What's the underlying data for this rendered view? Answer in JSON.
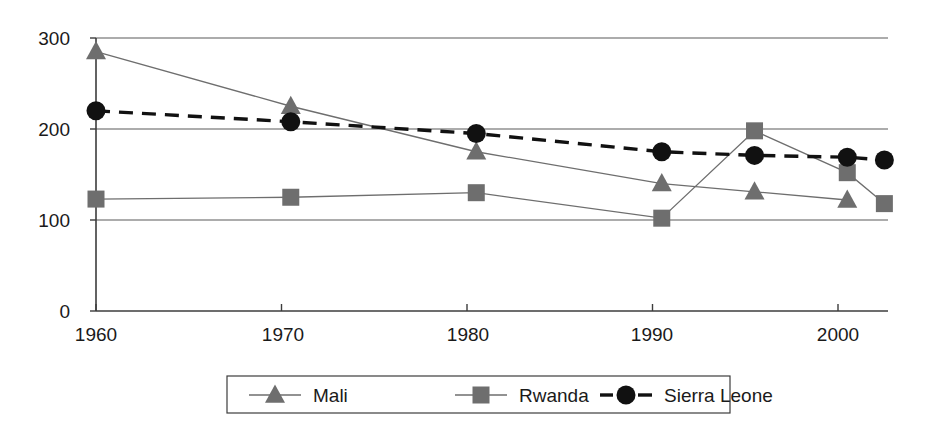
{
  "chart_data": {
    "type": "line",
    "title": "",
    "subtitle": "",
    "xlabel": "",
    "ylabel": "",
    "xlim": [
      1958,
      2004.5
    ],
    "ylim": [
      0,
      300
    ],
    "grid": true,
    "grid_axis": "y",
    "legend_position": "bottom",
    "x_ticks": [
      "1960",
      "1970",
      "1980",
      "1990",
      "2000"
    ],
    "x_tick_values": [
      1960,
      1970,
      1980,
      1990,
      2000
    ],
    "y_ticks": [
      "0",
      "100",
      "200",
      "300"
    ],
    "y_tick_values": [
      0,
      100,
      200,
      300
    ],
    "series": [
      {
        "name": "Mali",
        "marker": "triangle",
        "color": "#6e6e6e",
        "line_style": "solid",
        "x": [
          1960,
          1970.5,
          1980.5,
          1990.5,
          1995.5,
          2000.5
        ],
        "values": [
          285,
          225,
          175,
          140,
          131,
          122
        ]
      },
      {
        "name": "Rwanda",
        "marker": "square",
        "color": "#6e6e6e",
        "line_style": "solid",
        "x": [
          1960,
          1970.5,
          1980.5,
          1990.5,
          1995.5,
          2000.5,
          2002.5
        ],
        "values": [
          123,
          125,
          130,
          102,
          198,
          152,
          118
        ]
      },
      {
        "name": "Sierra Leone",
        "marker": "circle",
        "color": "#111111",
        "line_style": "dashed",
        "x": [
          1960,
          1970.5,
          1980.5,
          1990.5,
          1995.5,
          2000.5,
          2002.5
        ],
        "values": [
          220,
          208,
          195,
          175,
          171,
          169,
          166
        ]
      }
    ]
  },
  "legend": {
    "entries": [
      {
        "label": "Mali",
        "marker": "triangle-icon",
        "color": "#6e6e6e",
        "line_style": "solid"
      },
      {
        "label": "Rwanda",
        "marker": "square-icon",
        "color": "#6e6e6e",
        "line_style": "solid"
      },
      {
        "label": "Sierra Leone",
        "marker": "circle-icon",
        "color": "#111111",
        "line_style": "dashed"
      }
    ]
  },
  "axes": {
    "y_tick_labels": [
      "300",
      "200",
      "100",
      "0"
    ],
    "x_tick_labels": [
      "1960",
      "1970",
      "1980",
      "1990",
      "2000"
    ]
  },
  "colors": {
    "series_gray": "#6e6e6e",
    "series_black": "#111111",
    "grid": "#5a5a5a",
    "axis": "#3c3c3c",
    "background": "#ffffff",
    "text": "#1a1a1a"
  }
}
